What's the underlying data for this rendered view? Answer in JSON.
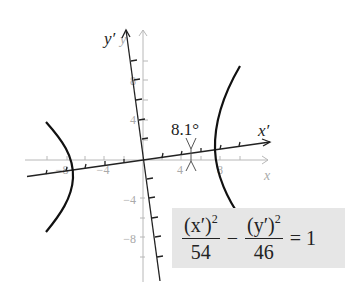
{
  "figure": {
    "type": "rotated-hyperbola",
    "rotation_angle_label": "8.1°",
    "axes": {
      "original": {
        "x_label": "x",
        "y_label": "y",
        "x_ticks": [
          "-8",
          "-4",
          "4",
          "8"
        ],
        "y_ticks": [
          "8",
          "4",
          "-4",
          "-8"
        ],
        "color": "#b0b0b0"
      },
      "rotated": {
        "x_label": "x′",
        "y_label": "y′",
        "color": "#222222"
      }
    },
    "curve_color": "#111111"
  },
  "equation": {
    "num1": "(x′)",
    "num1_exp": "2",
    "den1": "54",
    "operator": "−",
    "num2": "(y′)",
    "num2_exp": "2",
    "den2": "46",
    "equals": "=",
    "rhs": "1",
    "background": "#e6e6e6"
  }
}
